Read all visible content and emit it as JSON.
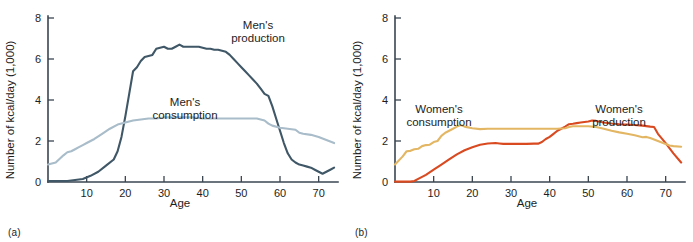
{
  "figure": {
    "panels": [
      {
        "id": "a",
        "caption": "(a)",
        "xlabel": "Age",
        "ylabel": "Number of kcal/day (1,000)",
        "label_production": "Men's\nproduction",
        "label_production_line1": "Men's",
        "label_production_line2": "production",
        "label_consumption_line1": "Men's",
        "label_consumption_line2": "consumption"
      },
      {
        "id": "b",
        "caption": "(b)",
        "xlabel": "Age",
        "ylabel": "Number of kcal/day (1,000)",
        "label_production_line1": "Women's",
        "label_production_line2": "production",
        "label_consumption_line1": "Women's",
        "label_consumption_line2": "consumption"
      }
    ]
  },
  "colors": {
    "men_production": "#3f5767",
    "men_consumption": "#a8bcc9",
    "women_production": "#d94a21",
    "women_consumption": "#e3b664",
    "axis": "#3a4550",
    "text": "#1d1d1d",
    "background": "#ffffff"
  },
  "chart_data": [
    {
      "type": "line",
      "panel": "a",
      "title": "",
      "xlabel": "Age",
      "ylabel": "Number of kcal/day (1,000)",
      "xlim": [
        0,
        75
      ],
      "ylim": [
        0,
        8
      ],
      "xticks": [
        10,
        20,
        30,
        40,
        50,
        60,
        70
      ],
      "yticks": [
        0,
        2,
        4,
        6,
        8
      ],
      "grid": false,
      "legend": "inline-annotations",
      "series": [
        {
          "name": "Men's production",
          "color": "#3f5767",
          "x": [
            0,
            3,
            5,
            7,
            9,
            11,
            13,
            15,
            17,
            18,
            19,
            20,
            21,
            22,
            23,
            24,
            25,
            26,
            27,
            28,
            29,
            30,
            31,
            32,
            33,
            34,
            35,
            36,
            37,
            38,
            39,
            40,
            41,
            42,
            43,
            44,
            45,
            46,
            47,
            48,
            49,
            50,
            51,
            52,
            53,
            54,
            55,
            56,
            57,
            58,
            59,
            60,
            61,
            62,
            63,
            64,
            65,
            66,
            67,
            68,
            69,
            70,
            71,
            72,
            73,
            74
          ],
          "y": [
            0.05,
            0.05,
            0.05,
            0.1,
            0.15,
            0.3,
            0.5,
            0.8,
            1.1,
            1.5,
            2.2,
            3.2,
            4.3,
            5.4,
            5.6,
            5.9,
            6.1,
            6.15,
            6.2,
            6.5,
            6.55,
            6.6,
            6.5,
            6.5,
            6.6,
            6.7,
            6.6,
            6.6,
            6.6,
            6.6,
            6.6,
            6.55,
            6.5,
            6.5,
            6.45,
            6.45,
            6.4,
            6.35,
            6.2,
            6.0,
            5.8,
            5.6,
            5.4,
            5.2,
            5.0,
            4.8,
            4.55,
            4.3,
            4.2,
            3.7,
            3.1,
            2.5,
            1.9,
            1.4,
            1.1,
            0.95,
            0.85,
            0.8,
            0.75,
            0.7,
            0.6,
            0.5,
            0.4,
            0.5,
            0.6,
            0.7
          ]
        },
        {
          "name": "Men's consumption",
          "color": "#a8bcc9",
          "x": [
            0,
            2,
            4,
            5,
            6,
            7,
            8,
            9,
            10,
            12,
            14,
            16,
            18,
            20,
            22,
            24,
            26,
            28,
            30,
            32,
            34,
            36,
            38,
            40,
            42,
            44,
            46,
            48,
            50,
            52,
            54,
            55,
            56,
            57,
            58,
            60,
            62,
            64,
            65,
            66,
            68,
            70,
            72,
            74
          ],
          "y": [
            0.85,
            0.95,
            1.3,
            1.45,
            1.5,
            1.6,
            1.7,
            1.8,
            1.9,
            2.1,
            2.35,
            2.6,
            2.8,
            2.9,
            3.0,
            3.05,
            3.1,
            3.1,
            3.15,
            3.15,
            3.15,
            3.15,
            3.15,
            3.1,
            3.1,
            3.1,
            3.1,
            3.1,
            3.1,
            3.1,
            3.1,
            3.05,
            3.0,
            2.85,
            2.75,
            2.65,
            2.6,
            2.55,
            2.4,
            2.35,
            2.3,
            2.2,
            2.05,
            1.9
          ]
        }
      ]
    },
    {
      "type": "line",
      "panel": "b",
      "title": "",
      "xlabel": "Age",
      "ylabel": "Number of kcal/day (1,000)",
      "xlim": [
        0,
        75
      ],
      "ylim": [
        0,
        8
      ],
      "xticks": [
        10,
        20,
        30,
        40,
        50,
        60,
        70
      ],
      "yticks": [
        0,
        2,
        4,
        6,
        8
      ],
      "grid": false,
      "legend": "inline-annotations",
      "series": [
        {
          "name": "Women's production",
          "color": "#d94a21",
          "x": [
            0,
            2,
            4,
            5,
            6,
            8,
            10,
            12,
            14,
            16,
            18,
            20,
            22,
            24,
            26,
            27,
            28,
            30,
            32,
            34,
            36,
            37,
            38,
            39,
            40,
            41,
            42,
            43,
            44,
            45,
            46,
            47,
            48,
            50,
            51,
            52,
            54,
            56,
            58,
            60,
            62,
            64,
            66,
            67,
            68,
            70,
            72,
            74
          ],
          "y": [
            0.02,
            0.02,
            0.02,
            0.05,
            0.15,
            0.35,
            0.6,
            0.85,
            1.1,
            1.35,
            1.55,
            1.7,
            1.82,
            1.88,
            1.9,
            1.88,
            1.86,
            1.86,
            1.86,
            1.86,
            1.87,
            1.87,
            1.95,
            2.1,
            2.2,
            2.35,
            2.5,
            2.6,
            2.7,
            2.82,
            2.84,
            2.87,
            2.9,
            2.95,
            3.0,
            2.98,
            2.9,
            2.85,
            2.82,
            2.8,
            2.78,
            2.75,
            2.7,
            2.68,
            2.35,
            1.9,
            1.4,
            0.95
          ]
        },
        {
          "name": "Women's consumption",
          "color": "#e3b664",
          "x": [
            0,
            2,
            3,
            4,
            5,
            6,
            7,
            8,
            9,
            10,
            11,
            12,
            13,
            14,
            15,
            16,
            17,
            18,
            20,
            22,
            24,
            26,
            28,
            30,
            32,
            34,
            36,
            38,
            40,
            42,
            44,
            45,
            46,
            48,
            50,
            52,
            54,
            56,
            58,
            60,
            62,
            64,
            65,
            66,
            68,
            70,
            71,
            72,
            74
          ],
          "y": [
            0.85,
            1.25,
            1.5,
            1.52,
            1.6,
            1.62,
            1.75,
            1.8,
            1.82,
            1.95,
            2.0,
            2.25,
            2.4,
            2.5,
            2.6,
            2.7,
            2.78,
            2.7,
            2.62,
            2.58,
            2.6,
            2.6,
            2.6,
            2.6,
            2.6,
            2.6,
            2.6,
            2.6,
            2.6,
            2.6,
            2.62,
            2.68,
            2.72,
            2.72,
            2.72,
            2.68,
            2.6,
            2.5,
            2.42,
            2.35,
            2.28,
            2.18,
            2.2,
            2.15,
            2.0,
            1.85,
            1.78,
            1.75,
            1.72
          ]
        }
      ]
    }
  ]
}
